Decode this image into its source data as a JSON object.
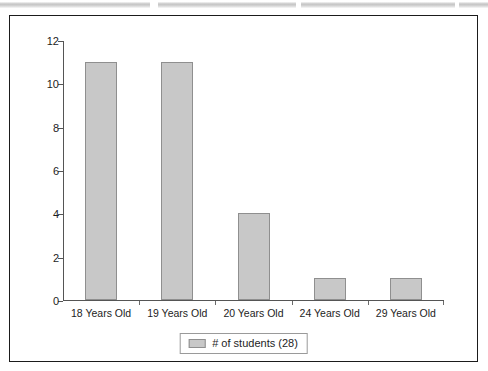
{
  "chart_data": {
    "type": "bar",
    "title": "",
    "xlabel": "",
    "ylabel": "",
    "categories": [
      "18 Years Old",
      "19 Years Old",
      "20 Years Old",
      "24 Years Old",
      "29 Years Old"
    ],
    "values": [
      11,
      11,
      4,
      1,
      1
    ],
    "series": [
      {
        "name": "# of students (28)",
        "values": [
          11,
          11,
          4,
          1,
          1
        ]
      }
    ],
    "ylim": [
      0,
      12
    ],
    "yticks": [
      "0",
      "2",
      "4",
      "6",
      "8",
      "10",
      "12"
    ],
    "ytick_values": [
      0,
      2,
      4,
      6,
      8,
      10,
      12
    ],
    "grid": false,
    "legend": {
      "position": "bottom",
      "entries": [
        {
          "label": "# of students (28)",
          "color": "#c8c8c8"
        }
      ]
    },
    "colors": {
      "bar_fill": "#c8c8c8",
      "bar_border": "#8f8f8f",
      "axis": "#555555",
      "text": "#1d1d1d",
      "frame": "#1b1b1b",
      "background": "#ffffff"
    }
  }
}
